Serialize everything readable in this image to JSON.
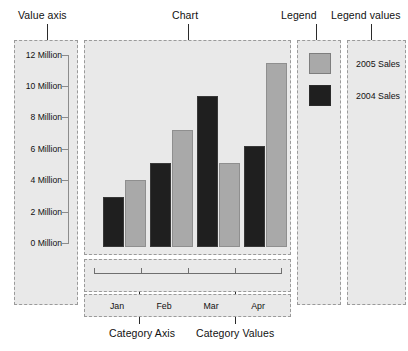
{
  "callouts": {
    "value_axis": "Value axis",
    "chart": "Chart",
    "legend": "Legend",
    "legend_values": "Legend values",
    "category_axis": "Category Axis",
    "category_values": "Category Values"
  },
  "legend": {
    "entries": [
      {
        "label": "2005 Sales",
        "color": "#a9a9a9"
      },
      {
        "label": "2004 Sales",
        "color": "#1f1f1f"
      }
    ]
  },
  "colors": {
    "series_2004": "#1f1f1f",
    "series_2005": "#a9a9a9",
    "panel_fill": "#e9e9e9",
    "panel_border": "#9a9a9a",
    "axis_line": "#8c8c8c"
  },
  "chart_data": {
    "type": "bar",
    "title": "Chart",
    "xlabel": "Category Axis",
    "ylabel": "Value axis",
    "categories": [
      "Jan",
      "Feb",
      "Mar",
      "Apr"
    ],
    "series": [
      {
        "name": "2004 Sales",
        "color": "#1f1f1f",
        "values": [
          3,
          5,
          9,
          6
        ]
      },
      {
        "name": "2005 Sales",
        "color": "#a9a9a9",
        "values": [
          4,
          7,
          5,
          11
        ]
      }
    ],
    "ylim": [
      0,
      12
    ],
    "ytick_values": [
      0,
      2,
      4,
      6,
      8,
      10,
      12
    ],
    "ytick_labels": [
      "0 Million",
      "2 Million",
      "4 Million",
      "6 Million",
      "8 Million",
      "10 Million",
      "12 Million"
    ],
    "yunit": "Million",
    "grid": false,
    "legend_position": "right"
  }
}
